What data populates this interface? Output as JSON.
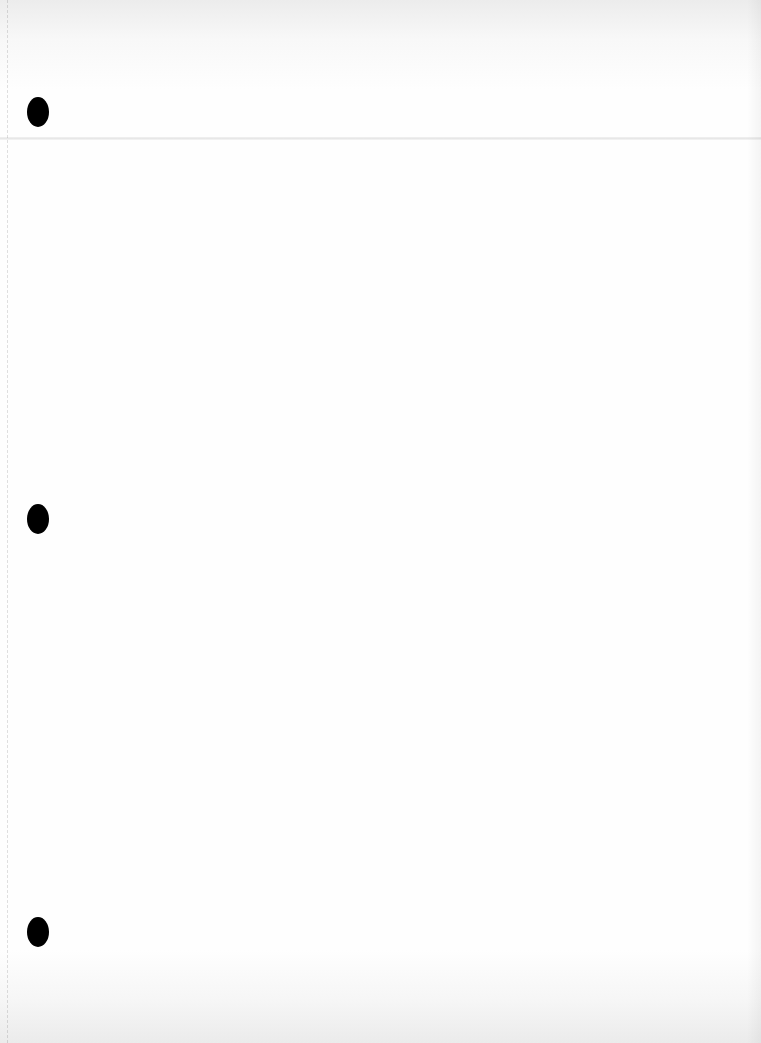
{
  "document": {
    "type": "blank scanned page",
    "background_color": "#fdfdfd",
    "text_content": "",
    "punch_holes": [
      {
        "x": 38,
        "y": 112
      },
      {
        "x": 38,
        "y": 519
      },
      {
        "x": 38,
        "y": 932
      }
    ],
    "punch_hole_color": "#000000"
  }
}
